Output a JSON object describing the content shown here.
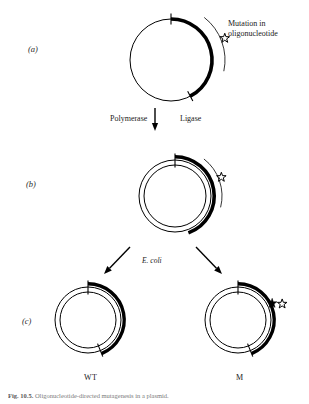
{
  "figure": {
    "background_color": "#ffffff",
    "ink_color": "#000000"
  },
  "panels": [
    {
      "id": "a",
      "label": "(a)",
      "label_x": 28,
      "label_y": 50
    },
    {
      "id": "b",
      "label": "(b)",
      "label_x": 26,
      "label_y": 185
    },
    {
      "id": "c",
      "label": "(c)",
      "label_x": 22,
      "label_y": 322
    }
  ],
  "annotations": {
    "mutation_line1": "Mutation in",
    "mutation_line2": "oligonucleotide",
    "mutation_x": 228,
    "mutation_y": 25,
    "polymerase": "Polymerase",
    "polymerase_x": 110,
    "polymerase_y": 114,
    "ligase": "Ligase",
    "ligase_x": 180,
    "ligase_y": 114,
    "ecoli": "E. coli",
    "ecoli_x": 142,
    "ecoli_y": 256
  },
  "strand_labels": [
    {
      "name": "wild-type",
      "text": "WT",
      "x": 88,
      "y": 379
    },
    {
      "name": "mutant",
      "text": "M",
      "x": 239,
      "y": 379
    }
  ],
  "caption": {
    "bold": "Fig. 10.5.",
    "text": "Oligonucleotide-directed mutagenesis in a plasmid."
  },
  "diagram_data": {
    "type": "diagram",
    "circles": [
      {
        "name": "template-circle-a",
        "panel": "a",
        "cx": 171,
        "cy": 60,
        "r": 41,
        "template_stroke": 1.0,
        "arc": {
          "start_deg": -90,
          "end_deg": 62,
          "thickness": 3.6
        },
        "ticks": [
          -90,
          62
        ],
        "stars": [
          {
            "kind": "open",
            "angle_deg": -22,
            "radius_offset": 17
          }
        ],
        "leader_arc": {
          "start_deg": -52,
          "end_deg": 12,
          "radius_offset": 13
        },
        "second_strand": false
      },
      {
        "name": "heteroduplex-circle-b",
        "panel": "b",
        "cx": 175,
        "cy": 196,
        "r": 36,
        "template_stroke": 1.0,
        "arc": {
          "start_deg": -90,
          "end_deg": 70,
          "thickness": 3.6
        },
        "ticks": [
          -90
        ],
        "stars": [
          {
            "kind": "open",
            "angle_deg": -22,
            "radius_offset": 14
          }
        ],
        "leader_arc": {
          "start_deg": -52,
          "end_deg": 14,
          "radius_offset": 11
        },
        "second_strand": true,
        "second_strand_offset": 5
      },
      {
        "name": "wild-type-circle",
        "panel": "c",
        "cx": 88,
        "cy": 320,
        "r": 33,
        "template_stroke": 1.0,
        "arc": {
          "start_deg": -90,
          "end_deg": 68,
          "thickness": 3.4
        },
        "ticks": [
          -90,
          68
        ],
        "stars": [],
        "second_strand": true,
        "second_strand_offset": 5
      },
      {
        "name": "mutant-circle",
        "panel": "c",
        "cx": 238,
        "cy": 320,
        "r": 33,
        "template_stroke": 1.0,
        "arc": {
          "start_deg": -90,
          "end_deg": 68,
          "thickness": 3.4
        },
        "ticks": [
          -90,
          68
        ],
        "stars": [
          {
            "kind": "filled",
            "angle_deg": -26,
            "radius_offset": 5
          },
          {
            "kind": "open",
            "angle_deg": -20,
            "radius_offset": 14
          }
        ],
        "second_strand": true,
        "second_strand_offset": 5
      }
    ],
    "arrows": [
      {
        "name": "arrow-a-to-b",
        "x1": 155,
        "y1": 108,
        "x2": 155,
        "y2": 131,
        "head": 5
      },
      {
        "name": "arrow-b-to-wt",
        "x1": 130,
        "y1": 247,
        "x2": 104,
        "y2": 274,
        "head": 5
      },
      {
        "name": "arrow-b-to-m",
        "x1": 196,
        "y1": 247,
        "x2": 222,
        "y2": 274,
        "head": 5
      }
    ]
  }
}
